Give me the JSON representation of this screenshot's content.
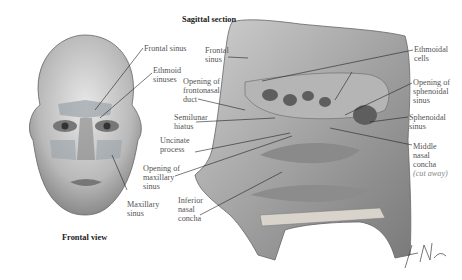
{
  "frontal": {
    "caption": "Frontal view",
    "labels": {
      "frontal_sinus": "Frontal sinus",
      "ethmoid_sinuses": "Ethmoid\nsinuses",
      "maxillary_sinus": "Maxillary\nsinus"
    }
  },
  "sagittal": {
    "caption": "Sagittal section",
    "labels": {
      "frontal_sinus": "Frontal\nsinus",
      "opening_frontonasal": "Opening of\nfrontonasal\nduct",
      "semilunar_hiatus": "Semilunar\nhiatus",
      "uncinate_process": "Uncinate\nprocess",
      "opening_maxillary": "Opening of\nmaxillary\nsinus",
      "inferior_concha": "Inferior\nnasal\nconcha",
      "ethmoidal_cells": "Ethmoidal\ncells",
      "opening_sphenoidal": "Opening of\nsphenoidal\nsinus",
      "sphenoidal_sinus": "Sphenoidal\nsinus",
      "middle_concha": "Middle\nnasal\nconcha",
      "cut_away": "(cut away)"
    }
  },
  "signature": "F. Netter"
}
